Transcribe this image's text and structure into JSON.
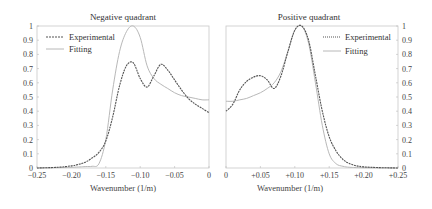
{
  "chart_data": [
    {
      "type": "line",
      "title": "Negative quadrant",
      "xlabel": "Wavenumber (1/m)",
      "ylabel": "",
      "xlim": [
        -0.25,
        0
      ],
      "ylim": [
        0,
        1
      ],
      "xticks": [
        -0.25,
        -0.2,
        -0.15,
        -0.1,
        -0.05,
        0
      ],
      "xtick_labels": [
        "−0.25",
        "−0.20",
        "−0.15",
        "−0.10",
        "−0.05",
        "0"
      ],
      "yticks": [
        0,
        0.1,
        0.2,
        0.3,
        0.4,
        0.5,
        0.6,
        0.7,
        0.8,
        0.9,
        1
      ],
      "ytick_labels": [
        "0",
        "0.1",
        "0.2",
        "0.3",
        "0.4",
        "0.5",
        "0.6",
        "0.7",
        "0.8",
        "0.9",
        "1"
      ],
      "yaxis_side": "left",
      "grid": false,
      "legend_position": "upper left",
      "series": [
        {
          "name": "Experimental",
          "style": "dashed-dark",
          "x": [
            -0.25,
            -0.22,
            -0.2,
            -0.19,
            -0.18,
            -0.17,
            -0.16,
            -0.15,
            -0.14,
            -0.13,
            -0.12,
            -0.11,
            -0.1,
            -0.09,
            -0.08,
            -0.07,
            -0.06,
            -0.05,
            -0.04,
            -0.03,
            -0.02,
            -0.01,
            0
          ],
          "y": [
            0.0,
            0.005,
            0.015,
            0.025,
            0.04,
            0.07,
            0.11,
            0.19,
            0.36,
            0.58,
            0.72,
            0.74,
            0.63,
            0.57,
            0.65,
            0.73,
            0.69,
            0.62,
            0.55,
            0.49,
            0.45,
            0.42,
            0.39
          ]
        },
        {
          "name": "Fitting",
          "style": "solid-light",
          "x": [
            -0.25,
            -0.2,
            -0.18,
            -0.17,
            -0.16,
            -0.15,
            -0.14,
            -0.13,
            -0.12,
            -0.11,
            -0.1,
            -0.09,
            -0.08,
            -0.07,
            -0.06,
            -0.05,
            -0.04,
            -0.03,
            -0.02,
            -0.01,
            0
          ],
          "y": [
            0.0,
            0.005,
            0.01,
            0.012,
            0.03,
            0.2,
            0.55,
            0.82,
            0.96,
            1.0,
            0.92,
            0.72,
            0.63,
            0.59,
            0.56,
            0.53,
            0.51,
            0.5,
            0.49,
            0.48,
            0.48
          ]
        }
      ]
    },
    {
      "type": "line",
      "title": "Positive quadrant",
      "xlabel": "Wavenumber (1/m)",
      "ylabel": "",
      "xlim": [
        0,
        0.25
      ],
      "ylim": [
        0,
        1
      ],
      "xticks": [
        0,
        0.05,
        0.1,
        0.15,
        0.2,
        0.25
      ],
      "xtick_labels": [
        "0",
        "+0.05",
        "+0.10",
        "+0.15",
        "+0.20",
        "+0.25"
      ],
      "yticks": [
        0,
        0.1,
        0.2,
        0.3,
        0.4,
        0.5,
        0.6,
        0.7,
        0.8,
        0.9,
        1
      ],
      "ytick_labels": [
        "0",
        "0.1",
        "0.2",
        "0.3",
        "0.4",
        "0.5",
        "0.6",
        "0.7",
        "0.8",
        "0.9",
        "1"
      ],
      "yaxis_side": "right",
      "grid": false,
      "legend_position": "upper right",
      "series": [
        {
          "name": "Experimental",
          "style": "dashed-dark",
          "x": [
            0,
            0.01,
            0.02,
            0.03,
            0.04,
            0.05,
            0.06,
            0.07,
            0.08,
            0.09,
            0.1,
            0.11,
            0.12,
            0.13,
            0.14,
            0.15,
            0.16,
            0.17,
            0.18,
            0.19,
            0.2,
            0.22,
            0.25
          ],
          "y": [
            0.4,
            0.45,
            0.55,
            0.61,
            0.64,
            0.65,
            0.62,
            0.56,
            0.65,
            0.82,
            0.97,
            1.0,
            0.9,
            0.65,
            0.4,
            0.22,
            0.12,
            0.06,
            0.03,
            0.015,
            0.008,
            0.003,
            0.0
          ]
        },
        {
          "name": "Fitting",
          "style": "solid-light",
          "x": [
            0,
            0.01,
            0.02,
            0.03,
            0.04,
            0.05,
            0.06,
            0.07,
            0.08,
            0.09,
            0.1,
            0.11,
            0.12,
            0.13,
            0.14,
            0.15,
            0.16,
            0.17,
            0.18,
            0.2,
            0.25
          ],
          "y": [
            0.47,
            0.47,
            0.48,
            0.49,
            0.51,
            0.53,
            0.56,
            0.6,
            0.68,
            0.82,
            0.97,
            1.0,
            0.88,
            0.6,
            0.3,
            0.1,
            0.03,
            0.012,
            0.005,
            0.002,
            0.0
          ]
        }
      ]
    }
  ],
  "panels": {
    "left": {
      "title": "Negative quadrant",
      "xlabel": "Wavenumber (1/m)",
      "legend": [
        "Experimental",
        "Fitting"
      ]
    },
    "right": {
      "title": "Positive quadrant",
      "xlabel": "Wavenumber (1/m)",
      "legend": [
        "Experimental",
        "Fitting"
      ]
    }
  },
  "colors": {
    "experimental": "#555555",
    "fitting": "#b8b8b8",
    "axis": "#bbbbbb",
    "text": "#444444"
  }
}
